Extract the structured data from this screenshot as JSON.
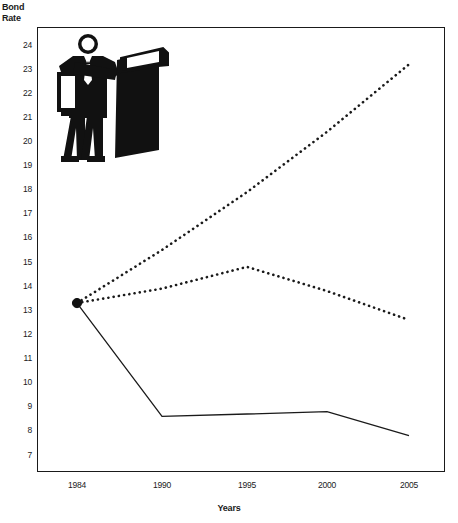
{
  "chart_data": {
    "type": "line",
    "title": "",
    "xlabel": "Years",
    "ylabel": "Bond Rate",
    "x": [
      1984,
      1990,
      1995,
      2000,
      2005
    ],
    "categories": [
      "1984",
      "1990",
      "1995",
      "2000",
      "2005"
    ],
    "xlim": [
      1984,
      2005
    ],
    "ylim": [
      7,
      24
    ],
    "grid": false,
    "legend": "none",
    "yticks": [
      24,
      23,
      22,
      21,
      20,
      19,
      18,
      17,
      16,
      15,
      14,
      13,
      12,
      11,
      10,
      9,
      8,
      7
    ],
    "series": [
      {
        "name": "High projection",
        "style": "dotted",
        "values": [
          13.3,
          15.5,
          17.9,
          20.4,
          23.2
        ]
      },
      {
        "name": "Middle projection",
        "style": "dotted",
        "values": [
          13.3,
          13.9,
          14.8,
          13.8,
          12.6
        ]
      },
      {
        "name": "Low projection",
        "style": "solid",
        "values": [
          13.3,
          8.6,
          8.7,
          8.8,
          7.8
        ]
      }
    ],
    "markers": [
      {
        "x": 1984,
        "y": 13.3,
        "shape": "circle",
        "filled": true
      }
    ]
  },
  "axes": {
    "y_title_line1": "Bond",
    "y_title_line2": "Rate",
    "x_title": "Years"
  },
  "decoration": {
    "clipart_name": "businessman-with-briefcase-illustration"
  }
}
